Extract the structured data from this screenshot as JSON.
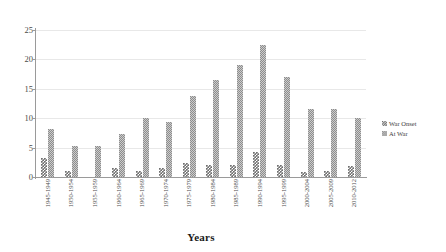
{
  "chart_data": {
    "type": "bar",
    "title": "",
    "xlabel": "Years",
    "ylabel": "",
    "ylim": [
      0,
      25
    ],
    "yticks": [
      0,
      5,
      10,
      15,
      20,
      25
    ],
    "grid": true,
    "legend_position": "right",
    "categories": [
      "1945-1949",
      "1950-1954",
      "1955-1959",
      "1960-1964",
      "1965-1969",
      "1970-1974",
      "1975-1979",
      "1980-1984",
      "1985-1989",
      "1990-1994",
      "1995-1999",
      "2000-2004",
      "2005-2009",
      "2010-2012"
    ],
    "series": [
      {
        "name": "War Onset",
        "values": [
          3.2,
          1.0,
          0.0,
          1.5,
          1.0,
          1.6,
          2.3,
          2.1,
          2.1,
          4.3,
          2.1,
          0.8,
          1.1,
          1.8
        ]
      },
      {
        "name": "At War",
        "values": [
          8.2,
          5.2,
          5.2,
          7.4,
          10.0,
          9.3,
          13.7,
          16.5,
          19.0,
          22.4,
          17.0,
          11.5,
          11.5,
          10.0
        ]
      }
    ]
  },
  "legend": {
    "items": [
      {
        "label": "War Onset",
        "swatch": "checkered-swatch"
      },
      {
        "label": "At War",
        "swatch": "hatched-swatch"
      }
    ]
  },
  "axes": {
    "x_title": "Years",
    "y_tick_labels": [
      "0",
      "5",
      "10",
      "15",
      "20",
      "25"
    ]
  },
  "colors": {
    "war_onset": "#6f6f6f",
    "at_war": "#8d8d8d",
    "gridline": "#e8e8e8",
    "axis": "#9a9a9a",
    "text": "#3d3d3d"
  }
}
